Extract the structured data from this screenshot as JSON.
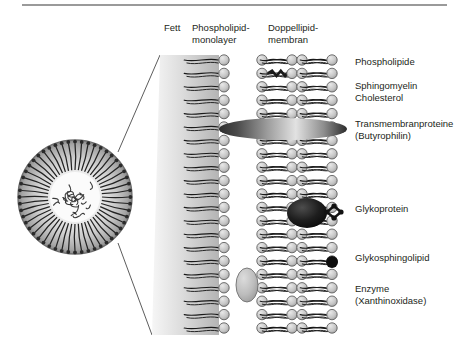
{
  "figure": {
    "kind": "milk-fat-globule-membrane-diagram",
    "background": "#ffffff",
    "border_color": "#9a9a9a"
  },
  "headers": [
    {
      "id": "fett",
      "label": "Fett",
      "x": 164,
      "y": 22
    },
    {
      "id": "monolayer",
      "label": "Phospholipid-\nmonolayer",
      "x": 192,
      "y": 22
    },
    {
      "id": "bilayer",
      "label": "Doppellipid-\nmembran",
      "x": 268,
      "y": 22
    }
  ],
  "labels": [
    {
      "id": "phospholipide",
      "label": "Phospholipide",
      "x": 355,
      "y": 56
    },
    {
      "id": "sphingomyelin",
      "label": "Sphingomyelin\nCholesterol",
      "x": 355,
      "y": 80
    },
    {
      "id": "transmembranprot",
      "label": "Transmembranproteine\n(Butyrophilin)",
      "x": 355,
      "y": 118
    },
    {
      "id": "glykoprotein",
      "label": "Glykoprotein",
      "x": 355,
      "y": 203
    },
    {
      "id": "glykosphingolipid",
      "label": "Glykosphingolipid",
      "x": 355,
      "y": 252
    },
    {
      "id": "enzyme",
      "label": "Enzyme\n(Xanthinoxidase)",
      "x": 355,
      "y": 283
    }
  ],
  "globule": {
    "cx": 75,
    "cy": 197,
    "r": 57,
    "core_r": 25,
    "n_tails": 52,
    "rim_color": "#6d6d6d",
    "fill_light": "#f2f2f2",
    "fill_mid": "#bdbdbd"
  },
  "fat_panel": {
    "top_y": 55,
    "bottom_y": 335,
    "left_top_x": 160,
    "left_bottom_x": 152,
    "right_x": 219,
    "grad_from": "#f4f4f4",
    "grad_to": "#b9b9b9"
  },
  "leader_lines": [
    {
      "x1": 118,
      "y1": 152,
      "x2": 160,
      "y2": 55
    },
    {
      "x1": 118,
      "y1": 243,
      "x2": 152,
      "y2": 335
    }
  ],
  "membranes": {
    "head_radius": 5.2,
    "head_fill": "#c9c9c9",
    "head_stroke": "#5a5a5a",
    "tail_color": "#1a1a1a",
    "row_top": 60,
    "row_step": 13.4,
    "row_count": 21,
    "monolayer": {
      "head_x": 224,
      "tail_dir": -1,
      "tail_len": 34
    },
    "bilayer_inner": {
      "leaflet_a_x": 262,
      "leaflet_b_x": 292,
      "tail_len": 26
    },
    "bilayer_outer": {
      "leaflet_a_x": 302,
      "leaflet_b_x": 332,
      "tail_len": 26
    }
  },
  "special_lipids": [
    {
      "id": "sphingomyelin-a",
      "leaflet": "bilayer_inner_a",
      "row": 1
    },
    {
      "id": "sphingomyelin-b",
      "leaflet": "bilayer_outer_b",
      "row": 5
    }
  ],
  "overlays": {
    "transmembrane_protein": {
      "cx": 283,
      "cy": 129,
      "rx": 64,
      "ry": 11,
      "color_dark": "#3a3a3a",
      "color_light": "#d8d8d8"
    },
    "glycoprotein": {
      "cx": 307,
      "cy": 213,
      "rx": 20,
      "ry": 15,
      "color": "#1e1e1e",
      "chain": [
        [
          327,
          212
        ],
        [
          334,
          206
        ],
        [
          334,
          218
        ],
        [
          341,
          212
        ]
      ]
    },
    "glykosphingolipid": {
      "cx": 332,
      "cy": 262,
      "r": 6,
      "color": "#0d0d0d"
    },
    "enzyme": {
      "cx": 247,
      "cy": 285,
      "rx": 11,
      "ry": 17,
      "fill": "#b4b4b4",
      "stroke": "#6f6f6f"
    }
  },
  "colors": {
    "text": "#231f20",
    "gray_panel": "#c4c4c4",
    "head": "#c9c9c9",
    "tail": "#1a1a1a",
    "protein_dark": "#1e1e1e"
  }
}
